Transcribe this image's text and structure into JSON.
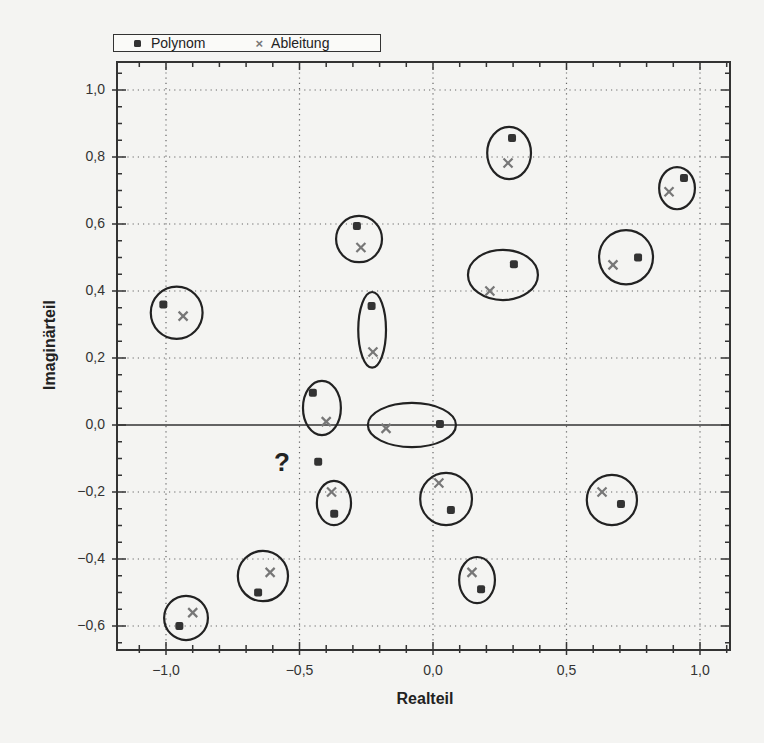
{
  "chart_data": {
    "type": "scatter",
    "title": "",
    "xlabel": "Realteil",
    "ylabel": "Imaginärteil",
    "xlim": [
      -1.2,
      1.11
    ],
    "ylim": [
      -0.67,
      1.08
    ],
    "grid": true,
    "legend_position": "top-left, above plot",
    "x_ticks": [
      -1.0,
      -0.5,
      0.0,
      0.5,
      1.0
    ],
    "x_tick_labels": [
      "−1,0",
      "−0,5",
      "0,0",
      "0,5",
      "1,0"
    ],
    "y_ticks": [
      1.0,
      0.8,
      0.6,
      0.4,
      0.2,
      0.0,
      -0.2,
      -0.4,
      -0.6
    ],
    "y_tick_labels": [
      "1,0",
      "0,8",
      "0,6",
      "0,4",
      "0,2",
      "0,0",
      "−0,2",
      "−0,4",
      "−0,6"
    ],
    "series": [
      {
        "name": "Polynom",
        "marker": "square-dot",
        "color": "#333333",
        "points": [
          [
            -1.01,
            0.36
          ],
          [
            -0.285,
            0.594
          ],
          [
            -0.23,
            0.355
          ],
          [
            0.296,
            0.857
          ],
          [
            0.303,
            0.48
          ],
          [
            0.94,
            0.737
          ],
          [
            0.768,
            0.5
          ],
          [
            -0.45,
            0.096
          ],
          [
            0.026,
            0.003
          ],
          [
            -0.43,
            -0.11
          ],
          [
            -0.37,
            -0.265
          ],
          [
            0.067,
            -0.254
          ],
          [
            0.704,
            -0.236
          ],
          [
            0.18,
            -0.49
          ],
          [
            -0.655,
            -0.5
          ],
          [
            -0.95,
            -0.6
          ]
        ]
      },
      {
        "name": "Ableitung",
        "marker": "x",
        "color": "#777777",
        "points": [
          [
            -0.936,
            0.325
          ],
          [
            -0.27,
            0.53
          ],
          [
            -0.225,
            0.218
          ],
          [
            0.281,
            0.782
          ],
          [
            0.213,
            0.4
          ],
          [
            0.884,
            0.696
          ],
          [
            0.674,
            0.478
          ],
          [
            -0.4,
            0.01
          ],
          [
            -0.176,
            -0.01
          ],
          [
            -0.38,
            -0.2
          ],
          [
            0.022,
            -0.173
          ],
          [
            0.633,
            -0.2
          ],
          [
            0.146,
            -0.44
          ],
          [
            -0.61,
            -0.44
          ],
          [
            -0.9,
            -0.56
          ]
        ]
      }
    ],
    "annotations": [
      {
        "type": "ellipse",
        "cx": -0.96,
        "cy": 0.335,
        "rx": 0.097,
        "ry": 0.078
      },
      {
        "type": "ellipse",
        "cx": -0.277,
        "cy": 0.555,
        "rx": 0.086,
        "ry": 0.069
      },
      {
        "type": "ellipse",
        "cx": -0.228,
        "cy": 0.284,
        "rx": 0.052,
        "ry": 0.113
      },
      {
        "type": "ellipse",
        "cx": 0.285,
        "cy": 0.812,
        "rx": 0.082,
        "ry": 0.078
      },
      {
        "type": "ellipse",
        "cx": 0.262,
        "cy": 0.448,
        "rx": 0.131,
        "ry": 0.075
      },
      {
        "type": "ellipse",
        "cx": 0.914,
        "cy": 0.707,
        "rx": 0.067,
        "ry": 0.063
      },
      {
        "type": "ellipse",
        "cx": 0.723,
        "cy": 0.501,
        "rx": 0.101,
        "ry": 0.081
      },
      {
        "type": "ellipse",
        "cx": -0.416,
        "cy": 0.051,
        "rx": 0.071,
        "ry": 0.081
      },
      {
        "type": "ellipse",
        "cx": -0.079,
        "cy": 0.0,
        "rx": 0.165,
        "ry": 0.066
      },
      {
        "type": "ellipse",
        "cx": -0.371,
        "cy": -0.233,
        "rx": 0.064,
        "ry": 0.066
      },
      {
        "type": "ellipse",
        "cx": 0.049,
        "cy": -0.221,
        "rx": 0.097,
        "ry": 0.078
      },
      {
        "type": "ellipse",
        "cx": 0.67,
        "cy": -0.224,
        "rx": 0.094,
        "ry": 0.075
      },
      {
        "type": "ellipse",
        "cx": 0.165,
        "cy": -0.463,
        "rx": 0.067,
        "ry": 0.069
      },
      {
        "type": "ellipse",
        "cx": -0.637,
        "cy": -0.451,
        "rx": 0.094,
        "ry": 0.075
      },
      {
        "type": "ellipse",
        "cx": -0.925,
        "cy": -0.576,
        "rx": 0.082,
        "ry": 0.066
      },
      {
        "type": "text",
        "x": -0.56,
        "y": -0.1,
        "text": "?"
      }
    ]
  },
  "legend": {
    "items": [
      {
        "label": "Polynom",
        "marker": "dot"
      },
      {
        "label": "Ableitung",
        "marker": "x"
      }
    ]
  },
  "axes": {
    "xlabel": "Realteil",
    "ylabel": "Imaginärteil"
  },
  "annotation_text": "?",
  "layout": {
    "frame": {
      "left": 117,
      "top": 62,
      "right": 730,
      "bottom": 650
    },
    "x0px": 433,
    "xscale": 267,
    "y0px": 425,
    "yscale": 335
  }
}
